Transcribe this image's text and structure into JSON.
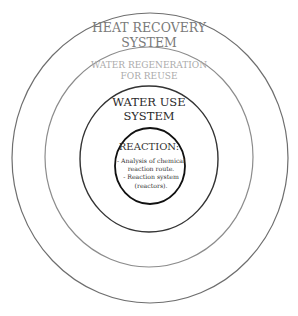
{
  "diagram": {
    "type": "concentric-circles",
    "rings": [
      {
        "id": "heat-recovery",
        "label_lines": [
          "HEAT RECOVERY",
          "SYSTEM"
        ],
        "stroke": "#6e6e6e",
        "text_color": "#7a7a7a"
      },
      {
        "id": "water-regeneration",
        "label_lines": [
          "WATER REGENERATION",
          "FOR REUSE"
        ],
        "stroke": "#8c8c8c",
        "text_color": "#ababab"
      },
      {
        "id": "water-use",
        "label_lines": [
          "WATER USE",
          "SYSTEM"
        ],
        "stroke": "#333333",
        "text_color": "#2a2a2a"
      },
      {
        "id": "reaction",
        "label_lines": [
          "REACTION:"
        ],
        "stroke": "#111111",
        "text_color": "#333333",
        "items": [
          "- Analysis of chemical",
          "reaction route.",
          "- Reaction system",
          "(reactors)."
        ]
      }
    ]
  }
}
